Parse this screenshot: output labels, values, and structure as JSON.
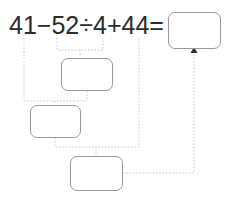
{
  "problem": {
    "equation_text": "41 − 52 ÷ 4 + 44 =",
    "tokens": [
      {
        "id": "num-41",
        "text": "41"
      },
      {
        "id": "op-minus",
        "text": "−"
      },
      {
        "id": "num-52",
        "text": "52"
      },
      {
        "id": "op-divide",
        "text": "÷"
      },
      {
        "id": "num-4",
        "text": "4"
      },
      {
        "id": "op-plus",
        "text": "+"
      },
      {
        "id": "num-44",
        "text": "44"
      },
      {
        "id": "op-equals",
        "text": "="
      }
    ]
  },
  "boxes": {
    "answer": {
      "label": "answer-box",
      "value": ""
    },
    "step1": {
      "label": "step-1-box",
      "value": ""
    },
    "step2": {
      "label": "step-2-box",
      "value": ""
    },
    "step3": {
      "label": "step-3-box",
      "value": ""
    }
  },
  "colors": {
    "text": "#2b2b2b",
    "box_border": "#9a9a9a",
    "connector": "#c9c9c9",
    "arrowhead": "#2b2b2b",
    "background": "#ffffff"
  },
  "connectors": [
    {
      "id": "conn-52-div-4-to-step1",
      "from": "52 ÷ 4",
      "to": "step1"
    },
    {
      "id": "conn-41-to-step2",
      "from": "41",
      "to": "step2"
    },
    {
      "id": "conn-step1-to-step2",
      "from": "step1",
      "to": "step2"
    },
    {
      "id": "conn-step2-to-step3",
      "from": "step2",
      "to": "step3"
    },
    {
      "id": "conn-44-to-step3",
      "from": "+ 44",
      "to": "step3"
    },
    {
      "id": "conn-step3-to-answer",
      "from": "step3",
      "to": "answer"
    }
  ]
}
